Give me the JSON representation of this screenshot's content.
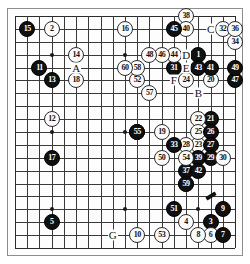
{
  "diagram": {
    "kind": "go-board-diagram",
    "board_size": 19,
    "visible_columns": 19,
    "visible_rows": 19,
    "colors": {
      "black_stone": "#101010",
      "white_stone": "#fbfbfb",
      "grid_line": "#3a3a3a",
      "background": "#ffffff",
      "board": "#fdfdfd"
    },
    "hoshi_points": [
      {
        "col": 3,
        "row": 3
      },
      {
        "col": 9,
        "row": 3
      },
      {
        "col": 15,
        "row": 3
      },
      {
        "col": 3,
        "row": 9
      },
      {
        "col": 9,
        "row": 9
      },
      {
        "col": 15,
        "row": 9
      },
      {
        "col": 3,
        "row": 15
      },
      {
        "col": 9,
        "row": 15
      },
      {
        "col": 15,
        "row": 15
      }
    ],
    "stones": [
      {
        "col": 15,
        "row": 3,
        "color": "black",
        "label": "1"
      },
      {
        "col": 3,
        "row": 1,
        "color": "white",
        "label": "2"
      },
      {
        "col": 16,
        "row": 16,
        "color": "black",
        "label": "3"
      },
      {
        "col": 14,
        "row": 16,
        "color": "white",
        "label": "4"
      },
      {
        "col": 3,
        "row": 16,
        "color": "black",
        "label": "5"
      },
      {
        "col": 16,
        "row": 17,
        "color": "white",
        "label": "6"
      },
      {
        "col": 17,
        "row": 17,
        "color": "black",
        "label": "7"
      },
      {
        "col": 15,
        "row": 17,
        "color": "white",
        "label": "8"
      },
      {
        "col": 17,
        "row": 15,
        "color": "black",
        "label": "9"
      },
      {
        "col": 10,
        "row": 17,
        "color": "white",
        "label": "10"
      },
      {
        "col": 2,
        "row": 4,
        "color": "black",
        "label": "11"
      },
      {
        "col": 3,
        "row": 8,
        "color": "white",
        "label": "12"
      },
      {
        "col": 3,
        "row": 5,
        "color": "black",
        "label": "13"
      },
      {
        "col": 5,
        "row": 3,
        "color": "white",
        "label": "14"
      },
      {
        "col": 1,
        "row": 1,
        "color": "black",
        "label": "15"
      },
      {
        "col": 9,
        "row": 1,
        "color": "white",
        "label": "16"
      },
      {
        "col": 3,
        "row": 11,
        "color": "black",
        "label": "17"
      },
      {
        "col": 5,
        "row": 5,
        "color": "white",
        "label": "18"
      },
      {
        "col": 12,
        "row": 9,
        "color": "white",
        "label": "19"
      },
      {
        "col": 16,
        "row": 5,
        "color": "white",
        "label": "20"
      },
      {
        "col": 16,
        "row": 8,
        "color": "black",
        "label": "21"
      },
      {
        "col": 15,
        "row": 8,
        "color": "white",
        "label": "22"
      },
      {
        "col": 15,
        "row": 10,
        "color": "white",
        "label": "23"
      },
      {
        "col": 14,
        "row": 5,
        "color": "white",
        "label": "24"
      },
      {
        "col": 15,
        "row": 9,
        "color": "white",
        "label": "25"
      },
      {
        "col": 16,
        "row": 9,
        "color": "black",
        "label": "26"
      },
      {
        "col": 16,
        "row": 10,
        "color": "black",
        "label": "27"
      },
      {
        "col": 14,
        "row": 10,
        "color": "white",
        "label": "28"
      },
      {
        "col": 16,
        "row": 11,
        "color": "black",
        "label": "29"
      },
      {
        "col": 17,
        "row": 11,
        "color": "white",
        "label": "30"
      },
      {
        "col": 13,
        "row": 4,
        "color": "black",
        "label": "31"
      },
      {
        "col": 17,
        "row": 1,
        "color": "white",
        "label": "32"
      },
      {
        "col": 13,
        "row": 10,
        "color": "black",
        "label": "33"
      },
      {
        "col": 18,
        "row": 2,
        "color": "white",
        "label": "34"
      },
      {
        "col": 10,
        "row": 9,
        "color": "black",
        "label": "35"
      },
      {
        "col": 18,
        "row": 1,
        "color": "white",
        "label": "36"
      },
      {
        "col": 14,
        "row": 12,
        "color": "black",
        "label": "37"
      },
      {
        "col": 14,
        "row": 0,
        "color": "white",
        "label": "38"
      },
      {
        "col": 15,
        "row": 11,
        "color": "black",
        "label": "39"
      },
      {
        "col": 14,
        "row": 1,
        "color": "white",
        "label": "40"
      },
      {
        "col": 16,
        "row": 4,
        "color": "black",
        "label": "41"
      },
      {
        "col": 15,
        "row": 12,
        "color": "black",
        "label": "42"
      },
      {
        "col": 15,
        "row": 4,
        "color": "black",
        "label": "43"
      },
      {
        "col": 13,
        "row": 3,
        "color": "white",
        "label": "44"
      },
      {
        "col": 13,
        "row": 1,
        "color": "black",
        "label": "45"
      },
      {
        "col": 12,
        "row": 3,
        "color": "white",
        "label": "46"
      },
      {
        "col": 18,
        "row": 5,
        "color": "black",
        "label": "47"
      },
      {
        "col": 11,
        "row": 3,
        "color": "white",
        "label": "48"
      },
      {
        "col": 18,
        "row": 4,
        "color": "black",
        "label": "49"
      },
      {
        "col": 12,
        "row": 11,
        "color": "white",
        "label": "50"
      },
      {
        "col": 13,
        "row": 15,
        "color": "black",
        "label": "51"
      },
      {
        "col": 10,
        "row": 5,
        "color": "white",
        "label": "52"
      },
      {
        "col": 12,
        "row": 17,
        "color": "white",
        "label": "53"
      },
      {
        "col": 14,
        "row": 11,
        "color": "white",
        "label": "54"
      },
      {
        "col": 10,
        "row": 9,
        "color": "black",
        "label": "55"
      },
      {
        "col": 14,
        "row": 13,
        "color": "white",
        "label": "56"
      },
      {
        "col": 11,
        "row": 6,
        "color": "white",
        "label": "57"
      },
      {
        "col": 10,
        "row": 4,
        "color": "white",
        "label": "58"
      },
      {
        "col": 14,
        "row": 13,
        "color": "black",
        "label": "59"
      },
      {
        "col": 9,
        "row": 4,
        "color": "white",
        "label": "60"
      }
    ],
    "letter_markers": [
      {
        "col": 5,
        "row": 4,
        "label": "A"
      },
      {
        "col": 15,
        "row": 6,
        "label": "B"
      },
      {
        "col": 16,
        "row": 1,
        "label": "C"
      },
      {
        "col": 14,
        "row": 3,
        "label": "D"
      },
      {
        "col": 14,
        "row": 4,
        "label": "E"
      },
      {
        "col": 13,
        "row": 5,
        "label": "F"
      },
      {
        "col": 8,
        "row": 17,
        "label": "G"
      }
    ],
    "extra_marks": [
      {
        "type": "tenuki-stroke",
        "col": 16,
        "row": 14
      }
    ]
  }
}
